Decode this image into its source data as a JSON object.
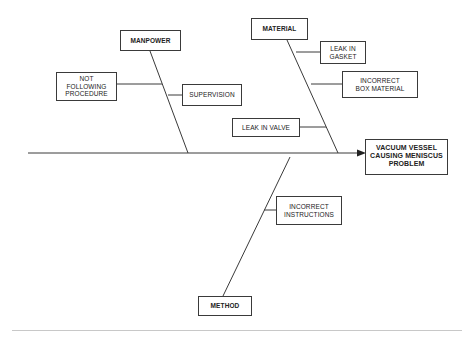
{
  "diagram": {
    "type": "fishbone",
    "effect": "VACUUM VESSEL\nCAUSING MENISCUS\nPROBLEM",
    "categories": [
      {
        "label": "MANPOWER",
        "causes": [
          "NOT\nFOLLOWING\nPROCEDURE",
          "SUPERVISION"
        ]
      },
      {
        "label": "MATERIAL",
        "causes": [
          "LEAK IN\nGASKET",
          "INCORRECT\nBOX MATERIAL",
          "LEAK IN VALVE"
        ]
      },
      {
        "label": "METHOD",
        "causes": [
          "INCORRECT\nINSTRUCTIONS"
        ]
      }
    ]
  },
  "colors": {
    "line": "#3a3a3a",
    "background": "#ffffff"
  }
}
